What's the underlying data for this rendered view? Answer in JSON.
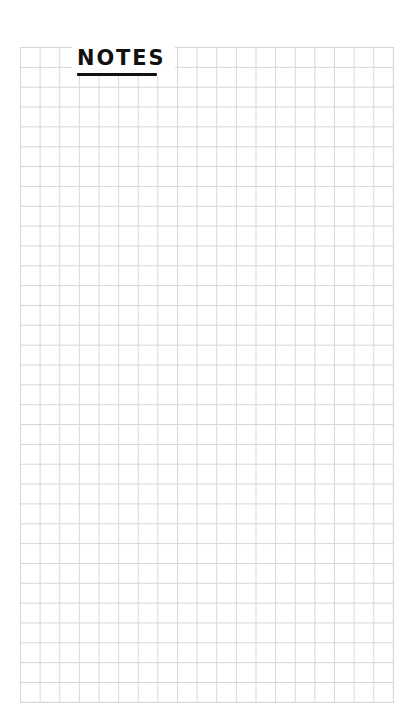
{
  "page": {
    "title": "NOTES",
    "grid": {
      "columns": 19,
      "rows": 33,
      "line_color": "#d6d6d6",
      "background": "#ffffff"
    },
    "colors": {
      "ink": "#111111"
    }
  }
}
